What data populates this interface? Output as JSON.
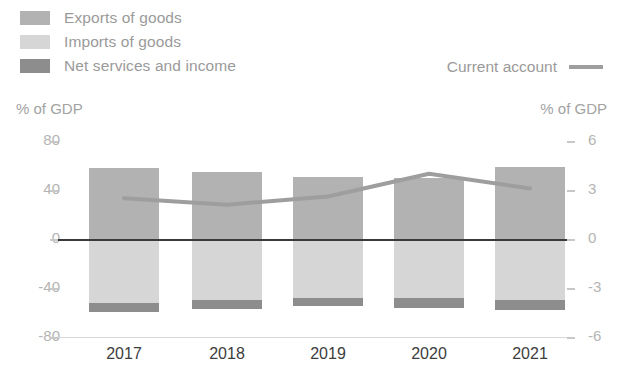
{
  "legend": {
    "series": [
      {
        "label": "Exports of goods",
        "swatch_name": "legend-swatch-exports",
        "color": "#b2b2b2"
      },
      {
        "label": "Imports of goods",
        "swatch_name": "legend-swatch-imports",
        "color": "#d6d6d6"
      },
      {
        "label": "Net services and income",
        "swatch_name": "legend-swatch-net-services",
        "color": "#8d8d8d"
      }
    ],
    "line_entry": {
      "label": "Current account",
      "color": "#9e9e9e"
    }
  },
  "axes": {
    "left_caption": "% of GDP",
    "right_caption": "% of GDP",
    "left_ticks": [
      "80",
      "40",
      "0",
      "-40",
      "-80"
    ],
    "right_ticks": [
      "6",
      "3",
      "0",
      "-3",
      "-6"
    ]
  },
  "chart_data": {
    "type": "bar",
    "title": "",
    "subtitle": "",
    "xlabel": "",
    "ylabel": "% of GDP",
    "y2label": "% of GDP",
    "categories": [
      "2017",
      "2018",
      "2019",
      "2020",
      "2021"
    ],
    "ylim": [
      -80,
      80
    ],
    "y2lim": [
      -6,
      6
    ],
    "yticks": [
      80,
      40,
      0,
      -40,
      -80
    ],
    "y2ticks": [
      6,
      3,
      0,
      -3,
      -6
    ],
    "grid": false,
    "stacked": true,
    "legend_position": "top-left",
    "series": [
      {
        "name": "Exports of goods",
        "axis": "left",
        "type": "bar",
        "color": "#b2b2b2",
        "values": [
          58,
          55,
          51,
          50,
          59
        ]
      },
      {
        "name": "Imports of goods",
        "axis": "left",
        "type": "bar",
        "color": "#d6d6d6",
        "values": [
          -52,
          -50,
          -48,
          -48,
          -50
        ]
      },
      {
        "name": "Net services and income",
        "axis": "left",
        "type": "bar",
        "color": "#8d8d8d",
        "values": [
          -8,
          -7,
          -7,
          -8,
          -8
        ]
      },
      {
        "name": "Current account",
        "axis": "right",
        "type": "line",
        "color": "#9e9e9e",
        "values": [
          2.5,
          2.1,
          2.6,
          4.0,
          3.1
        ]
      }
    ]
  }
}
